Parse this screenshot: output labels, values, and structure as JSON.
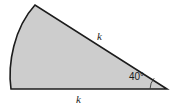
{
  "figure": {
    "kind": "circular-sector-diagram",
    "background_color": "#ffffff",
    "fill_color": "#cdcdcd",
    "stroke_color": "#1c1c1c",
    "stroke_width": 1.6,
    "labels": {
      "side_upper": "k",
      "side_lower": "k",
      "angle": "40°"
    },
    "geometry": {
      "center_vertex": {
        "x": 167,
        "y": 89
      },
      "base_vertex": {
        "x": 11,
        "y": 89
      },
      "apex_vertex": {
        "x": 35,
        "y": 5
      },
      "arc_bulge_x": 9,
      "angle_degrees": 40,
      "radius_label": "k"
    }
  }
}
